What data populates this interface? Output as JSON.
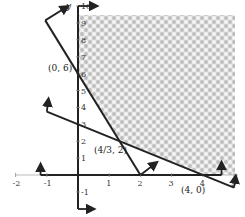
{
  "chart_data": {
    "type": "line",
    "title": "",
    "xlabel": "",
    "ylabel": "y",
    "xlim": [
      -2,
      5
    ],
    "ylim": [
      -2,
      10
    ],
    "x_ticks": [
      -2,
      -1,
      1,
      2,
      3,
      4,
      5
    ],
    "y_ticks": [
      -1,
      1,
      2,
      3,
      4,
      5,
      6,
      7,
      8,
      9,
      10
    ],
    "grid": false,
    "series": [
      {
        "name": "3x + y = 6",
        "x": [
          -1.05,
          2
        ],
        "y": [
          9.15,
          0
        ]
      },
      {
        "name": "3x + 4y = 12",
        "x": [
          -1,
          5
        ],
        "y": [
          3.75,
          -0.75
        ]
      }
    ],
    "feasible_region": {
      "description": "shaded region above both constraint lines, x >= 0",
      "vertices": [
        [
          0,
          10
        ],
        [
          5,
          10
        ],
        [
          5,
          0
        ],
        [
          4,
          0
        ],
        [
          1.3333,
          2
        ],
        [
          0,
          6
        ]
      ],
      "pattern": "checkerboard-gray"
    },
    "annotations": [
      {
        "label": "(0, 6)",
        "x": 0,
        "y": 6
      },
      {
        "label": "(4/3, 2)",
        "x": 1.3333,
        "y": 2
      },
      {
        "label": "(4, 0)",
        "x": 4,
        "y": 0
      }
    ]
  },
  "labels": {
    "y_axis": "y",
    "tick_x": [
      "-2",
      "-1",
      "1",
      "2",
      "3",
      "4",
      "5"
    ],
    "tick_y": [
      "-1",
      "1",
      "2",
      "3",
      "4",
      "5",
      "6",
      "7",
      "8",
      "9",
      "10"
    ],
    "pt_06": "(0, 6)",
    "pt_432": "(4/3, 2)",
    "pt_40": "(4, 0)",
    "x_end": "5",
    "y_end_small": "5"
  }
}
